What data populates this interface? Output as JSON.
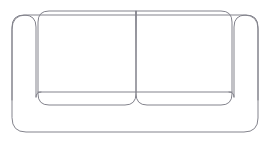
{
  "illustration": {
    "name": "sofa-line-drawing",
    "title": "Two-seat sofa front view outline",
    "subject": "sofa",
    "view": "front elevation",
    "style": "single-weight line drawing, no fill",
    "canvas": {
      "width": 270,
      "height": 142,
      "background_color": "#ffffff"
    },
    "stroke": {
      "color": "#83838c",
      "width": 1,
      "cap": "round",
      "join": "round"
    },
    "parts": [
      {
        "id": "sofa-body",
        "label": "Sofa body outline",
        "description": "Outer rounded-rectangle silhouette of the whole sofa frame",
        "corner_radius": 14,
        "bounds": {
          "x": 12,
          "y": 15,
          "width": 246,
          "height": 117
        },
        "path": "M 12 29 Q 12 15 26 15 L 244 15 Q 258 15 258 29 L 258 118 Q 258 132 244 132 L 26 132 Q 12 132 12 118 Z"
      },
      {
        "id": "armrest-left",
        "label": "Left armrest",
        "description": "Rounded-top vertical armrest panel on the left side",
        "corner_radius": 12,
        "bounds": {
          "x": 12,
          "y": 15,
          "width": 24,
          "height": 85
        },
        "path": "M 36 97 L 36 27 Q 36 15 24 15 Q 12 15 12 27 L 12 100"
      },
      {
        "id": "armrest-right",
        "label": "Right armrest",
        "description": "Rounded-top vertical armrest panel on the right side",
        "corner_radius": 12,
        "bounds": {
          "x": 234,
          "y": 15,
          "width": 24,
          "height": 85
        },
        "path": "M 234 97 L 234 27 Q 234 15 246 15 Q 258 15 258 27 L 258 100"
      },
      {
        "id": "cushion-left",
        "label": "Left back cushion",
        "description": "Large rounded-corner back cushion, left seat",
        "corner_radius": 11,
        "bounds": {
          "x": 38,
          "y": 11,
          "width": 98,
          "height": 94
        },
        "path": "M 136 11 L 49 11 Q 38 11 38 22 L 38 94 Q 38 105 49 105 L 125 105 Q 136 105 136 94 Z"
      },
      {
        "id": "cushion-right",
        "label": "Right back cushion",
        "description": "Large rounded-corner back cushion, right seat",
        "corner_radius": 11,
        "bounds": {
          "x": 136,
          "y": 11,
          "width": 96,
          "height": 94
        },
        "path": "M 136 11 L 221 11 Q 232 11 232 22 L 232 94 Q 232 105 221 105 L 147 105 Q 136 105 136 94 Z"
      },
      {
        "id": "seat-seam-line",
        "label": "Seat seam line",
        "description": "Horizontal seam across the lower cushions where seat meets back",
        "path": "M 38 92 L 232 92"
      },
      {
        "id": "armrest-left-foot-curve",
        "label": "Left armrest inner foot curve",
        "description": "Short curve where the left armrest inner edge turns into the seat seam",
        "path": "M 36 97 Q 36 92 41 92"
      },
      {
        "id": "armrest-right-foot-curve",
        "label": "Right armrest inner foot curve",
        "description": "Short curve where the right armrest inner edge turns into the seat seam",
        "path": "M 234 97 Q 234 92 229 92"
      }
    ]
  }
}
